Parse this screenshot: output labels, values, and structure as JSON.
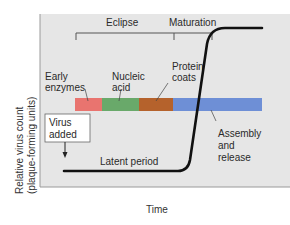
{
  "diagram": {
    "type": "viral one-step growth curve",
    "ylabel_line1": "Relative virus count",
    "ylabel_line2": "(plaque-forming units)",
    "xlabel": "Time",
    "phases": {
      "eclipse": "Eclipse",
      "maturation": "Maturation",
      "latent": "Latent period"
    },
    "labels": {
      "early_enzymes_1": "Early",
      "early_enzymes_2": "enzymes",
      "nucleic_acid_1": "Nucleic",
      "nucleic_acid_2": "acid",
      "protein_coats_1": "Protein",
      "protein_coats_2": "coats",
      "assembly_1": "Assembly",
      "assembly_2": "and",
      "assembly_3": "release",
      "virus_added_1": "Virus",
      "virus_added_2": "added"
    },
    "bar_segments": [
      {
        "name": "Early enzymes",
        "color": "#e9746f"
      },
      {
        "name": "Nucleic acid",
        "color": "#69a96a"
      },
      {
        "name": "Protein coats",
        "color": "#b5622c"
      },
      {
        "name": "Assembly and release",
        "color": "#6e8fd6"
      }
    ],
    "colors": {
      "panel_bg": "#e6e6e6",
      "curve": "#111111"
    }
  }
}
